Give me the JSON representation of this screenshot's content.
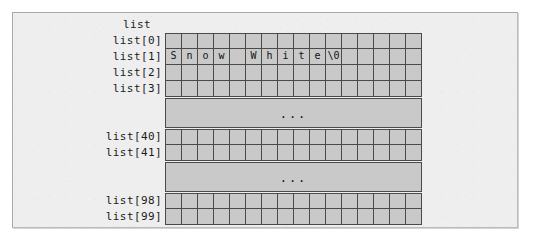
{
  "figure": {
    "title": "list",
    "caption_alignment": "right-of-labels",
    "colors": {
      "panel_background": "#eeeeee",
      "panel_border": "#a9a9a9",
      "cell_fill": "#c9c9c9",
      "cell_border": "#4a4a4a",
      "text": "#1c1c1c"
    },
    "grid": {
      "columns": 16,
      "cell_width_px": 16,
      "row_height_px": 16
    }
  },
  "rows": [
    {
      "label": "list[0]",
      "kind": "cells",
      "cells": [
        "",
        "",
        "",
        "",
        "",
        "",
        "",
        "",
        "",
        "",
        "",
        "",
        "",
        "",
        "",
        ""
      ]
    },
    {
      "label": "list[1]",
      "kind": "cells",
      "cells": [
        "S",
        "n",
        "o",
        "w",
        "",
        "W",
        "h",
        "i",
        "t",
        "e",
        "\\0",
        "",
        "",
        "",
        "",
        ""
      ]
    },
    {
      "label": "list[2]",
      "kind": "cells",
      "cells": [
        "",
        "",
        "",
        "",
        "",
        "",
        "",
        "",
        "",
        "",
        "",
        "",
        "",
        "",
        "",
        ""
      ]
    },
    {
      "label": "list[3]",
      "kind": "cells",
      "cells": [
        "",
        "",
        "",
        "",
        "",
        "",
        "",
        "",
        "",
        "",
        "",
        "",
        "",
        "",
        "",
        ""
      ]
    },
    {
      "label": "",
      "kind": "ellipsis",
      "text": "..."
    },
    {
      "label": "list[40]",
      "kind": "cells",
      "cells": [
        "",
        "",
        "",
        "",
        "",
        "",
        "",
        "",
        "",
        "",
        "",
        "",
        "",
        "",
        "",
        ""
      ]
    },
    {
      "label": "list[41]",
      "kind": "cells",
      "cells": [
        "",
        "",
        "",
        "",
        "",
        "",
        "",
        "",
        "",
        "",
        "",
        "",
        "",
        "",
        "",
        ""
      ]
    },
    {
      "label": "",
      "kind": "ellipsis",
      "text": "..."
    },
    {
      "label": "list[98]",
      "kind": "cells",
      "cells": [
        "",
        "",
        "",
        "",
        "",
        "",
        "",
        "",
        "",
        "",
        "",
        "",
        "",
        "",
        "",
        ""
      ]
    },
    {
      "label": "list[99]",
      "kind": "cells",
      "cells": [
        "",
        "",
        "",
        "",
        "",
        "",
        "",
        "",
        "",
        "",
        "",
        "",
        "",
        "",
        "",
        ""
      ]
    }
  ]
}
